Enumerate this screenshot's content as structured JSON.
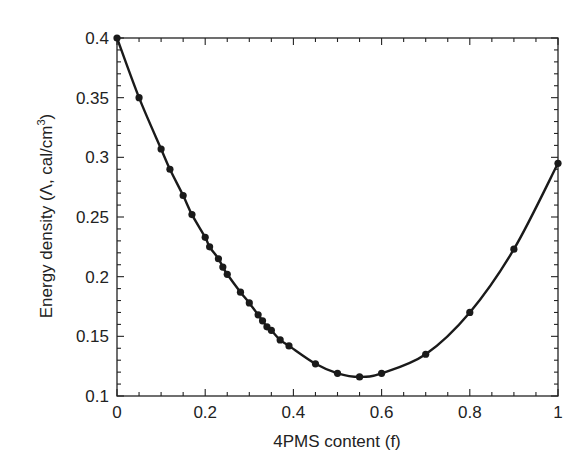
{
  "chart_data": {
    "type": "line",
    "title": "",
    "xlabel": "4PMS content (f)",
    "ylabel": "Energy density (Λ, cal/cm³)",
    "ylabel_parts": {
      "main": "Energy density (Λ, cal/cm",
      "sup": "3",
      "end": ")"
    },
    "xlim": [
      0,
      1
    ],
    "ylim": [
      0.1,
      0.4
    ],
    "x_ticks": [
      0,
      0.2,
      0.4,
      0.6,
      0.8,
      1
    ],
    "x_tick_labels": [
      "0",
      "0.2",
      "0.4",
      "0.6",
      "0.8",
      "1"
    ],
    "x_minor_step": 0.05,
    "y_ticks": [
      0.1,
      0.15,
      0.2,
      0.25,
      0.3,
      0.35,
      0.4
    ],
    "y_tick_labels": [
      "0.1",
      "0.15",
      "0.2",
      "0.25",
      "0.3",
      "0.35",
      "0.4"
    ],
    "y_minor_step": 0.01,
    "grid": false,
    "legend": null,
    "series": [
      {
        "name": "Energy density",
        "style": "line-with-markers",
        "color": "#1a1a1a",
        "x": [
          0,
          0.05,
          0.1,
          0.12,
          0.15,
          0.17,
          0.2,
          0.21,
          0.23,
          0.24,
          0.25,
          0.28,
          0.3,
          0.32,
          0.33,
          0.34,
          0.35,
          0.37,
          0.39,
          0.45,
          0.5,
          0.55,
          0.6,
          0.7,
          0.8,
          0.9,
          1.0
        ],
        "values": [
          0.4,
          0.35,
          0.307,
          0.29,
          0.268,
          0.252,
          0.233,
          0.225,
          0.215,
          0.208,
          0.202,
          0.187,
          0.178,
          0.168,
          0.163,
          0.158,
          0.155,
          0.147,
          0.142,
          0.127,
          0.119,
          0.116,
          0.119,
          0.135,
          0.17,
          0.223,
          0.295
        ]
      }
    ]
  }
}
